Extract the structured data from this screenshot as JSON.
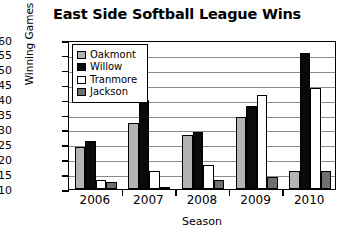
{
  "chart_data": {
    "type": "bar",
    "title": "East Side Softball League Wins",
    "xlabel": "Season",
    "ylabel": "Winning Games",
    "categories": [
      "2006",
      "2007",
      "2008",
      "2009",
      "2010"
    ],
    "ylim": [
      10,
      60
    ],
    "yticks": [
      60,
      55,
      50,
      45,
      40,
      35,
      30,
      25,
      20,
      15,
      10
    ],
    "grid": true,
    "legend_position": "top-left-inside",
    "series": [
      {
        "name": "Oakmont",
        "color": "#b3b3b3",
        "values": [
          24,
          32,
          28,
          34,
          16
        ]
      },
      {
        "name": "Willow",
        "color": "#0a0a0a",
        "values": [
          26,
          40,
          29,
          38,
          55.5
        ]
      },
      {
        "name": "Tranmore",
        "color": "#ffffff",
        "values": [
          13,
          16,
          18,
          41.5,
          44
        ]
      },
      {
        "name": "Jackson",
        "color": "#707070",
        "values": [
          12.5,
          10.5,
          13,
          14,
          16
        ]
      }
    ]
  }
}
